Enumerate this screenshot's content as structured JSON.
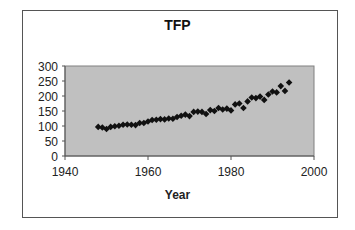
{
  "chart_data": {
    "type": "scatter",
    "title": "TFP",
    "xlabel": "Year",
    "ylabel": "",
    "xlim": [
      1940,
      2000
    ],
    "ylim": [
      0,
      300
    ],
    "xticks": [
      1940,
      1960,
      1980,
      2000
    ],
    "yticks": [
      0,
      50,
      100,
      150,
      200,
      250,
      300
    ],
    "grid": false,
    "legend": null,
    "marker": "diamond",
    "marker_color": "#111111",
    "plot_bg": "#c0c0c0",
    "series": [
      {
        "name": "TFP",
        "x": [
          1948,
          1949,
          1950,
          1951,
          1952,
          1953,
          1954,
          1955,
          1956,
          1957,
          1958,
          1959,
          1960,
          1961,
          1962,
          1963,
          1964,
          1965,
          1966,
          1967,
          1968,
          1969,
          1970,
          1971,
          1972,
          1973,
          1974,
          1975,
          1976,
          1977,
          1978,
          1979,
          1980,
          1981,
          1982,
          1983,
          1984,
          1985,
          1986,
          1987,
          1988,
          1989,
          1990,
          1991,
          1992,
          1993,
          1994
        ],
        "values": [
          97,
          95,
          90,
          97,
          99,
          101,
          104,
          105,
          104,
          103,
          110,
          110,
          115,
          120,
          121,
          123,
          122,
          125,
          124,
          130,
          134,
          138,
          133,
          147,
          148,
          147,
          140,
          153,
          150,
          160,
          155,
          158,
          152,
          172,
          175,
          160,
          182,
          195,
          193,
          198,
          187,
          205,
          215,
          212,
          233,
          217,
          245
        ]
      }
    ]
  }
}
